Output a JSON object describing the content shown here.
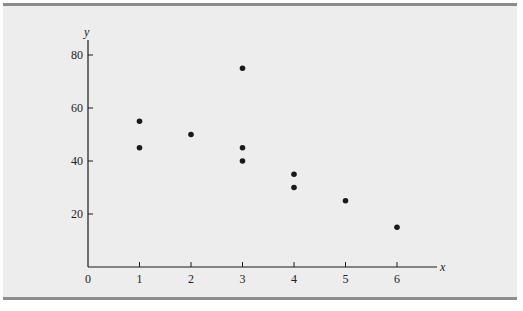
{
  "chart_data": {
    "type": "scatter",
    "title": "",
    "xlabel": "x",
    "ylabel": "y",
    "xlim": [
      0,
      6.8
    ],
    "ylim": [
      0,
      85
    ],
    "x_ticks": [
      0,
      1,
      2,
      3,
      4,
      5,
      6
    ],
    "y_ticks": [
      20,
      40,
      60,
      80
    ],
    "grid": false,
    "legend": null,
    "points": [
      {
        "x": 1,
        "y": 55
      },
      {
        "x": 1,
        "y": 45
      },
      {
        "x": 2,
        "y": 50
      },
      {
        "x": 3,
        "y": 75
      },
      {
        "x": 3,
        "y": 45
      },
      {
        "x": 3,
        "y": 40
      },
      {
        "x": 4,
        "y": 35
      },
      {
        "x": 4,
        "y": 30
      },
      {
        "x": 5,
        "y": 25
      },
      {
        "x": 6,
        "y": 15
      }
    ]
  },
  "style": {
    "background": "#ededed",
    "border": "#8c8c8c",
    "ink": "#1a1a1a"
  }
}
